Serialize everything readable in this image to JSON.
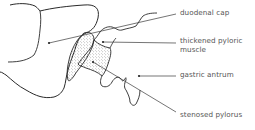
{
  "diagram": {
    "type": "anatomical",
    "stroke_color": "#2a2a2a",
    "leader_color": "#3a3a3a",
    "text_color": "#555555",
    "labels": [
      {
        "id": "duodenal-cap",
        "text": "duodenal cap"
      },
      {
        "id": "thickened-pyloric-muscle",
        "text": "thickened pyloric muscle"
      },
      {
        "id": "gastric-antrum",
        "text": "gastric antrum"
      },
      {
        "id": "stenosed-pylorus",
        "text": "stenosed pylorus"
      }
    ]
  }
}
